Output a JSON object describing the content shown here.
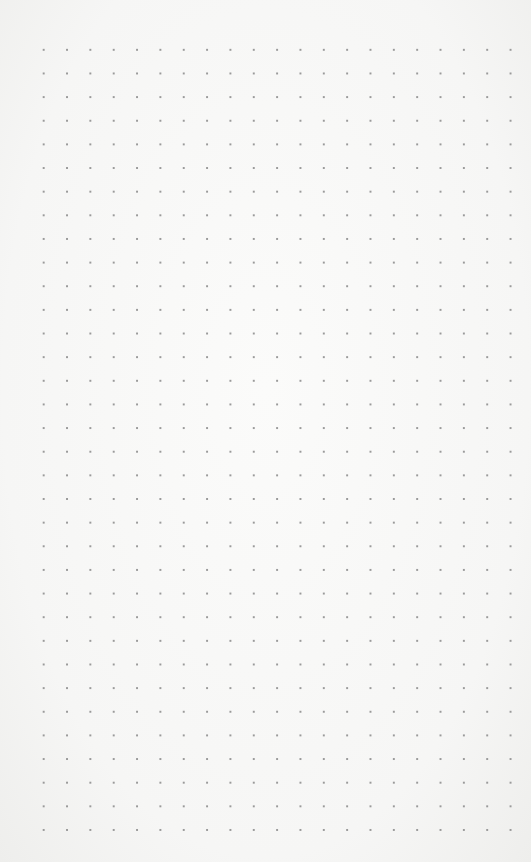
{
  "paper": {
    "kind": "dot-grid",
    "dot_color": "#9a9a9a",
    "background_color": "#f8f8f7",
    "columns": 22,
    "rows": 34,
    "spacing_px": [
      23.4,
      23.6
    ]
  }
}
